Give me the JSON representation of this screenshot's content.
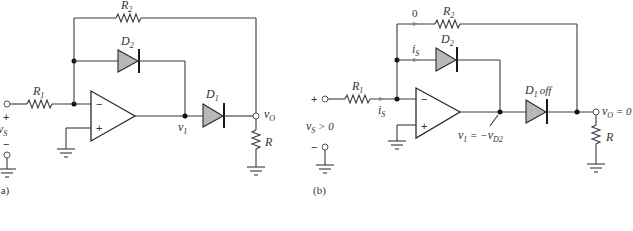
{
  "figure": {
    "panel_a": {
      "caption": "(a)",
      "components": {
        "R1": {
          "letter": "R",
          "sub": "1"
        },
        "R2": {
          "letter": "R",
          "sub": "2"
        },
        "D1": {
          "letter": "D",
          "sub": "1"
        },
        "D2": {
          "letter": "D",
          "sub": "2"
        },
        "R": {
          "letter": "R"
        }
      },
      "nodes": {
        "v1": {
          "letter": "v",
          "sub": "1"
        },
        "vO": {
          "letter": "v",
          "sub": "O"
        },
        "vS": {
          "letter": "v",
          "sub": "S"
        }
      },
      "source_plus": "+",
      "source_minus": "−",
      "opamp_minus": "−",
      "opamp_plus": "+"
    },
    "panel_b": {
      "caption": "(b)",
      "components": {
        "R1": {
          "letter": "R",
          "sub": "1"
        },
        "R2": {
          "letter": "R",
          "sub": "2"
        },
        "D1": {
          "letter": "D",
          "sub": "1",
          "state": "off"
        },
        "D2": {
          "letter": "D",
          "sub": "2"
        },
        "R": {
          "letter": "R"
        }
      },
      "currents": {
        "r2_current": "0",
        "d2_current": {
          "letter": "i",
          "sub": "S"
        },
        "r1_current": {
          "letter": "i",
          "sub": "S"
        }
      },
      "nodes": {
        "v1_eq": {
          "letter": "v",
          "sub": "1",
          "eq": " = −",
          "rhs_letter": "v",
          "rhs_sub": "D2"
        },
        "vO_eq": {
          "letter": "v",
          "sub": "O",
          "eq": " = 0"
        },
        "vS_cond": {
          "letter": "v",
          "sub": "S",
          "cond": " > 0"
        }
      },
      "source_plus": "+",
      "source_minus": "−",
      "opamp_minus": "−",
      "opamp_plus": "+"
    }
  }
}
